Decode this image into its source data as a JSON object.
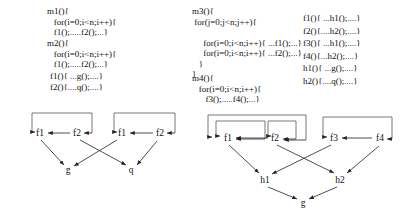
{
  "figure": {
    "background": "#ffffff",
    "line_color": "#222222",
    "box_color": "#555555"
  },
  "code_blocks": {
    "left": {
      "m1": [
        "m1(){",
        "   for(i=0;i<n;i++){",
        "   f1();.....f2();...}"
      ],
      "m2": [
        "m2(){",
        "   for(i=0;i<n;i++){",
        "   f1();.....f2();...}"
      ],
      "helpers": [
        "f1(){ ...g();....}",
        "f2(){....q();....}"
      ]
    },
    "right": {
      "m3": [
        "m3(){",
        " for(j=0;j<n;j++){",
        "",
        "     for(i=0;i<n;i++){ ...f1();...}",
        "     for(i=0;i<n;i++){ ...f2();...}",
        "   }",
        "}"
      ],
      "m4": [
        "m4(){",
        "   for(i=0;i<n;i++){",
        "      f3();.....f4();...}"
      ],
      "helpers": [
        "f1(){ ...h1();....}",
        "f2(){....h2();....}",
        "f3(){ ...h1();....}",
        "f4(){...h2();....}",
        "h1(){ ...g();....}",
        "h2(){....q();....}"
      ]
    }
  },
  "graphs": {
    "left": {
      "nodes": [
        {
          "id": "f1a",
          "label": "f1",
          "x": 40,
          "y": 133
        },
        {
          "id": "f2a",
          "label": "f2",
          "x": 77,
          "y": 133
        },
        {
          "id": "f1b",
          "label": "f1",
          "x": 122,
          "y": 133
        },
        {
          "id": "f2b",
          "label": "f2",
          "x": 160,
          "y": 133
        },
        {
          "id": "g",
          "label": "g",
          "x": 68,
          "y": 170
        },
        {
          "id": "q",
          "label": "q",
          "x": 131,
          "y": 170
        }
      ],
      "edges": [
        {
          "from": "f2a",
          "to": "f1a",
          "kind": "arrow"
        },
        {
          "from": "f2b",
          "to": "f1b",
          "kind": "arrow"
        },
        {
          "from": "f1a",
          "to": "g",
          "kind": "arrow"
        },
        {
          "from": "f2b",
          "to": "q",
          "kind": "arrow"
        },
        {
          "from": "f1b",
          "to": "g",
          "kind": "arrow"
        },
        {
          "from": "f2a",
          "to": "q",
          "kind": "arrow"
        }
      ]
    },
    "right": {
      "nodes": [
        {
          "id": "f1",
          "label": "f1",
          "x": 228,
          "y": 138
        },
        {
          "id": "f2",
          "label": "f2",
          "x": 275,
          "y": 138
        },
        {
          "id": "f3",
          "label": "f3",
          "x": 334,
          "y": 138
        },
        {
          "id": "f4",
          "label": "f4",
          "x": 380,
          "y": 138
        },
        {
          "id": "h1",
          "label": "h1",
          "x": 265,
          "y": 180
        },
        {
          "id": "h2",
          "label": "h2",
          "x": 340,
          "y": 180
        },
        {
          "id": "g",
          "label": "g",
          "x": 303,
          "y": 203
        }
      ],
      "edges": [
        {
          "from": "f2",
          "to": "f1",
          "kind": "arrow"
        },
        {
          "from": "f4",
          "to": "f3",
          "kind": "arrow"
        },
        {
          "from": "f1",
          "to": "h1",
          "kind": "arrow"
        },
        {
          "from": "f3",
          "to": "h1",
          "kind": "arrow"
        },
        {
          "from": "f2",
          "to": "h2",
          "kind": "arrow"
        },
        {
          "from": "f4",
          "to": "h2",
          "kind": "arrow"
        },
        {
          "from": "h1",
          "to": "g",
          "kind": "arrow"
        },
        {
          "from": "h2",
          "to": "g",
          "kind": "arrow"
        }
      ]
    }
  }
}
